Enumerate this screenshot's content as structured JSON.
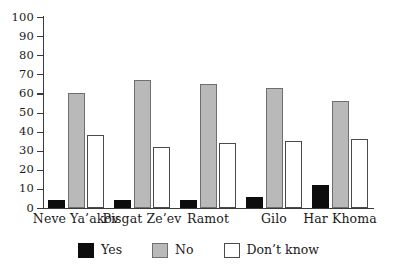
{
  "chart_data": {
    "type": "bar",
    "title": "",
    "xlabel": "",
    "ylabel": "",
    "ylim": [
      0,
      100
    ],
    "yticks": [
      0,
      10,
      20,
      30,
      40,
      50,
      60,
      70,
      80,
      90,
      100
    ],
    "grid": false,
    "legend_position": "bottom",
    "categories": [
      "Neve Ya’akov",
      "Pisgat Ze’ev",
      "Ramot",
      "Gilo",
      "Har Khoma"
    ],
    "series": [
      {
        "name": "Yes",
        "color": "#0d0d0d",
        "values": [
          4,
          4,
          4,
          6,
          12
        ]
      },
      {
        "name": "No",
        "color": "#b9b9b9",
        "values": [
          60,
          67,
          65,
          63,
          56
        ]
      },
      {
        "name": "Don’t know",
        "color": "#ffffff",
        "values": [
          38,
          32,
          34,
          35,
          36
        ]
      }
    ]
  },
  "legend": {
    "items": [
      {
        "label": "Yes",
        "swatch": "black-filled-square"
      },
      {
        "label": "No",
        "swatch": "gray-hatched-square"
      },
      {
        "label": "Don’t know",
        "swatch": "white-outlined-square"
      }
    ]
  }
}
